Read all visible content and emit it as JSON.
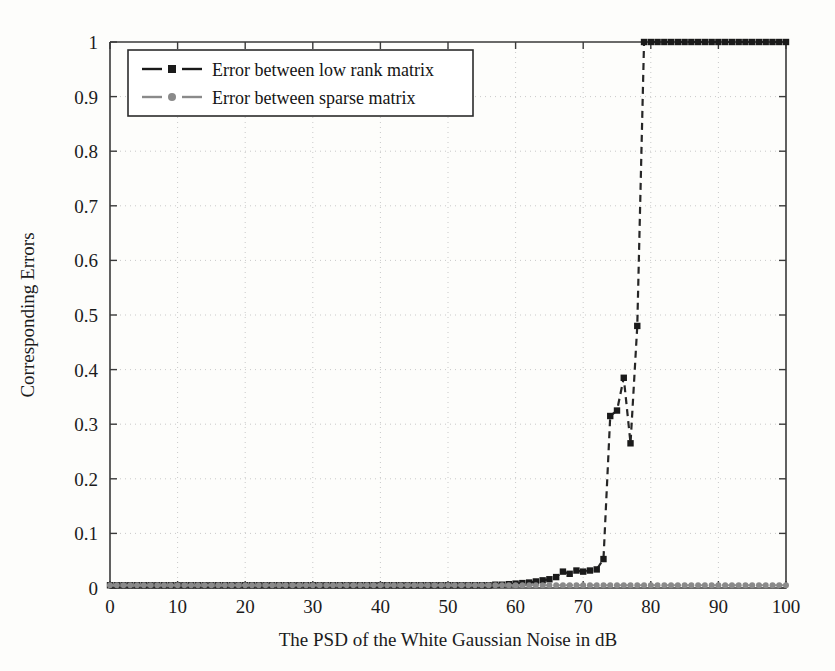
{
  "chart_data": {
    "type": "line",
    "title": "",
    "xlabel": "The PSD of the White Gaussian Noise in dB",
    "ylabel": "Corresponding Errors",
    "xlim": [
      0,
      100
    ],
    "ylim": [
      0,
      1
    ],
    "xticks": [
      0,
      10,
      20,
      30,
      40,
      50,
      60,
      70,
      80,
      90,
      100
    ],
    "yticks": [
      0,
      0.1,
      0.2,
      0.3,
      0.4,
      0.5,
      0.6,
      0.7,
      0.8,
      0.9,
      1
    ],
    "xtick_labels": [
      "0",
      "10",
      "20",
      "30",
      "40",
      "50",
      "60",
      "70",
      "80",
      "90",
      "100"
    ],
    "ytick_labels": [
      "0",
      "0.1",
      "0.2",
      "0.3",
      "0.4",
      "0.5",
      "0.6",
      "0.7",
      "0.8",
      "0.9",
      "1"
    ],
    "grid": true,
    "grid_style": "dotted",
    "legend_position": "upper left",
    "series": [
      {
        "name": "Error between low rank matrix",
        "color": "#1a1a1a",
        "marker": "square",
        "linestyle": "dashed",
        "x": [
          0,
          1,
          2,
          3,
          4,
          5,
          6,
          7,
          8,
          9,
          10,
          11,
          12,
          13,
          14,
          15,
          16,
          17,
          18,
          19,
          20,
          21,
          22,
          23,
          24,
          25,
          26,
          27,
          28,
          29,
          30,
          31,
          32,
          33,
          34,
          35,
          36,
          37,
          38,
          39,
          40,
          41,
          42,
          43,
          44,
          45,
          46,
          47,
          48,
          49,
          50,
          51,
          52,
          53,
          54,
          55,
          56,
          57,
          58,
          59,
          60,
          61,
          62,
          63,
          64,
          65,
          66,
          67,
          68,
          69,
          70,
          71,
          72,
          73,
          74,
          75,
          76,
          77,
          78,
          79,
          80,
          81,
          82,
          83,
          84,
          85,
          86,
          87,
          88,
          89,
          90,
          91,
          92,
          93,
          94,
          95,
          96,
          97,
          98,
          99,
          100
        ],
        "y": [
          0.005,
          0.005,
          0.005,
          0.005,
          0.005,
          0.005,
          0.005,
          0.005,
          0.005,
          0.005,
          0.005,
          0.005,
          0.005,
          0.005,
          0.005,
          0.005,
          0.005,
          0.005,
          0.005,
          0.005,
          0.005,
          0.005,
          0.005,
          0.005,
          0.005,
          0.005,
          0.005,
          0.005,
          0.005,
          0.005,
          0.005,
          0.005,
          0.005,
          0.005,
          0.005,
          0.005,
          0.005,
          0.005,
          0.005,
          0.005,
          0.005,
          0.005,
          0.005,
          0.005,
          0.005,
          0.005,
          0.005,
          0.005,
          0.005,
          0.005,
          0.005,
          0.005,
          0.005,
          0.005,
          0.005,
          0.005,
          0.005,
          0.006,
          0.006,
          0.007,
          0.008,
          0.009,
          0.01,
          0.012,
          0.014,
          0.016,
          0.02,
          0.03,
          0.026,
          0.032,
          0.03,
          0.032,
          0.034,
          0.053,
          0.315,
          0.325,
          0.385,
          0.265,
          0.48,
          1.0,
          1.0,
          1.0,
          1.0,
          1.0,
          1.0,
          1.0,
          1.0,
          1.0,
          1.0,
          1.0,
          1.0,
          1.0,
          1.0,
          1.0,
          1.0,
          1.0,
          1.0,
          1.0,
          1.0,
          1.0,
          1.0
        ]
      },
      {
        "name": "Error between sparse matrix",
        "color": "#8a8a8a",
        "marker": "circle",
        "linestyle": "dashed",
        "x": [
          0,
          1,
          2,
          3,
          4,
          5,
          6,
          7,
          8,
          9,
          10,
          11,
          12,
          13,
          14,
          15,
          16,
          17,
          18,
          19,
          20,
          21,
          22,
          23,
          24,
          25,
          26,
          27,
          28,
          29,
          30,
          31,
          32,
          33,
          34,
          35,
          36,
          37,
          38,
          39,
          40,
          41,
          42,
          43,
          44,
          45,
          46,
          47,
          48,
          49,
          50,
          51,
          52,
          53,
          54,
          55,
          56,
          57,
          58,
          59,
          60,
          61,
          62,
          63,
          64,
          65,
          66,
          67,
          68,
          69,
          70,
          71,
          72,
          73,
          74,
          75,
          76,
          77,
          78,
          79,
          80,
          81,
          82,
          83,
          84,
          85,
          86,
          87,
          88,
          89,
          90,
          91,
          92,
          93,
          94,
          95,
          96,
          97,
          98,
          99,
          100
        ],
        "y": [
          0.005,
          0.005,
          0.005,
          0.005,
          0.005,
          0.005,
          0.005,
          0.005,
          0.005,
          0.005,
          0.005,
          0.005,
          0.005,
          0.005,
          0.005,
          0.005,
          0.005,
          0.005,
          0.005,
          0.005,
          0.005,
          0.005,
          0.005,
          0.005,
          0.005,
          0.005,
          0.005,
          0.005,
          0.005,
          0.005,
          0.005,
          0.005,
          0.005,
          0.005,
          0.005,
          0.005,
          0.005,
          0.005,
          0.005,
          0.005,
          0.005,
          0.005,
          0.005,
          0.005,
          0.005,
          0.005,
          0.005,
          0.005,
          0.005,
          0.005,
          0.005,
          0.005,
          0.005,
          0.005,
          0.005,
          0.005,
          0.005,
          0.005,
          0.005,
          0.005,
          0.005,
          0.005,
          0.005,
          0.005,
          0.005,
          0.005,
          0.005,
          0.005,
          0.005,
          0.005,
          0.005,
          0.005,
          0.005,
          0.005,
          0.005,
          0.005,
          0.005,
          0.005,
          0.005,
          0.005,
          0.005,
          0.005,
          0.005,
          0.005,
          0.005,
          0.005,
          0.005,
          0.005,
          0.005,
          0.005,
          0.005,
          0.005,
          0.005,
          0.005,
          0.005,
          0.005,
          0.005,
          0.005,
          0.005,
          0.005,
          0.005
        ]
      }
    ]
  },
  "legend": {
    "entries": [
      {
        "label": "Error between low rank matrix"
      },
      {
        "label": "Error between sparse matrix"
      }
    ]
  },
  "colors": {
    "low_rank": "#1a1a1a",
    "sparse": "#8a8a8a",
    "axis": "#3a3a3a",
    "grid": "#c9c9c9",
    "background": "#fdfdfb"
  }
}
